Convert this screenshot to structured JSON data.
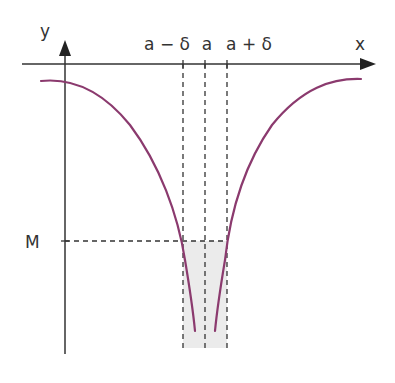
{
  "diagram": {
    "axes": {
      "x_label": "x",
      "y_label": "y"
    },
    "x_ticks": {
      "left": "a − δ",
      "center": "a",
      "right": "a + δ"
    },
    "y_marks": {
      "level": "M"
    },
    "colors": {
      "curve": "#8b3a6e",
      "axis": "#333333",
      "dash": "#333333",
      "shade": "#ebebeb"
    }
  }
}
